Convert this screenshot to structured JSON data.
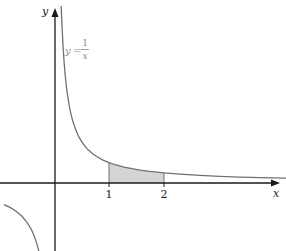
{
  "figure": {
    "axes": {
      "x_label": "x",
      "y_label": "y"
    },
    "curve": {
      "label_lhs": "y",
      "label_eq": "=",
      "label_num": "1",
      "label_den": "x",
      "function": "y = 1/x"
    },
    "ticks": [
      {
        "label": "1",
        "value": 1
      },
      {
        "label": "2",
        "value": 2
      }
    ],
    "shaded_region": {
      "from": 1,
      "to": 2,
      "description": "area under y = 1/x from x = 1 to x = 2"
    },
    "colors": {
      "axis": "#1a1a1a",
      "curve": "#707070",
      "shade": "#d4d4d4",
      "label": "#8a8a8a"
    }
  }
}
